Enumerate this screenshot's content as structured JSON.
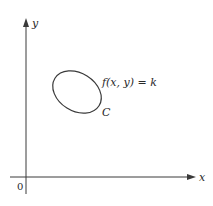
{
  "diagram": {
    "axes": {
      "x_label": "x",
      "y_label": "y",
      "origin_label": "0"
    },
    "curve": {
      "equation_label": "f(x, y) = k",
      "curve_label": "C"
    },
    "colors": {
      "stroke": "#3a3a3a",
      "background": "#ffffff"
    }
  }
}
